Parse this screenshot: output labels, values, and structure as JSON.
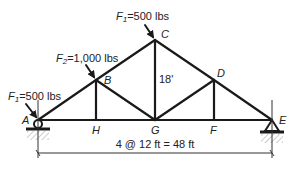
{
  "diagram": {
    "type": "truss",
    "nodes": [
      {
        "id": "A",
        "label": "A",
        "x": 38,
        "y": 120
      },
      {
        "id": "B",
        "label": "B",
        "x": 96,
        "y": 80
      },
      {
        "id": "C",
        "label": "C",
        "x": 155,
        "y": 40
      },
      {
        "id": "D",
        "label": "D",
        "x": 214,
        "y": 80
      },
      {
        "id": "E",
        "label": "E",
        "x": 272,
        "y": 120
      },
      {
        "id": "F",
        "label": "F",
        "x": 214,
        "y": 120
      },
      {
        "id": "G",
        "label": "G",
        "x": 155,
        "y": 120
      },
      {
        "id": "H",
        "label": "H",
        "x": 96,
        "y": 120
      }
    ],
    "members": [
      [
        "A",
        "B"
      ],
      [
        "B",
        "C"
      ],
      [
        "C",
        "D"
      ],
      [
        "D",
        "E"
      ],
      [
        "A",
        "H"
      ],
      [
        "H",
        "G"
      ],
      [
        "G",
        "F"
      ],
      [
        "F",
        "E"
      ],
      [
        "B",
        "H"
      ],
      [
        "C",
        "G"
      ],
      [
        "D",
        "F"
      ],
      [
        "B",
        "G"
      ],
      [
        "D",
        "G"
      ]
    ],
    "loads": [
      {
        "name": "F1-at-A",
        "label_main": "F",
        "label_sub": "1",
        "label_rest": "=500 lbs",
        "node": "A"
      },
      {
        "name": "F2-at-B",
        "label_main": "F",
        "label_sub": "2",
        "label_rest": "=1,000 lbs",
        "node": "B"
      },
      {
        "name": "F1-at-C",
        "label_main": "F",
        "label_sub": "1",
        "label_rest": "=500 lbs",
        "node": "C"
      }
    ],
    "height_label": "18'",
    "span_label": "4 @ 12 ft = 48 ft",
    "supports": [
      {
        "node": "A",
        "type": "roller"
      },
      {
        "node": "E",
        "type": "pin"
      }
    ]
  }
}
